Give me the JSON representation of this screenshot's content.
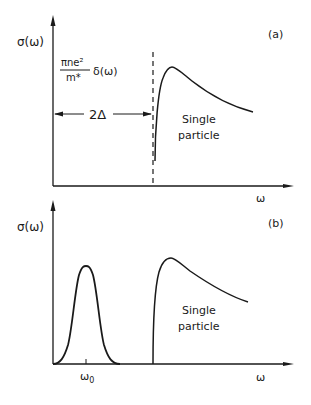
{
  "figure": {
    "panel_a": {
      "tag": "(a)",
      "ylabel": "σ(ω)",
      "xlabel": "ω",
      "delta_numerator": "πne²",
      "delta_denominator": "m*",
      "delta_term": "δ(ω)",
      "gap_label": "2Δ",
      "region_label_line1": "Single",
      "region_label_line2": "particle"
    },
    "panel_b": {
      "tag": "(b)",
      "ylabel": "σ(ω)",
      "xlabel": "ω",
      "peak_label": "ω",
      "peak_label_sub": "0",
      "region_label_line1": "Single",
      "region_label_line2": "particle"
    },
    "colors": {
      "ink": "#1a1a1a",
      "background": "#ffffff"
    }
  }
}
